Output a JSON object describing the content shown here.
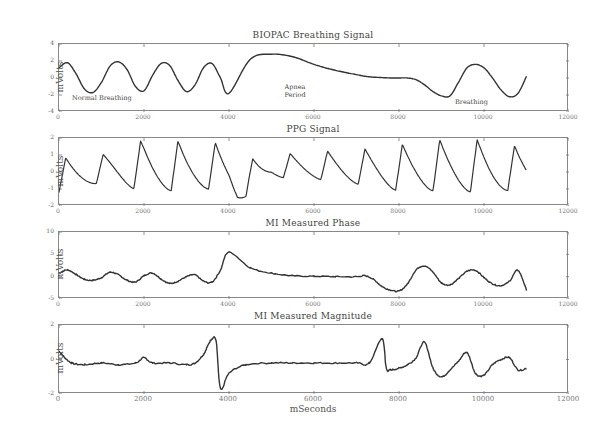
{
  "xlabel": "mSeconds",
  "ylabel": "mVolts",
  "chart_data": [
    {
      "type": "line",
      "title": "BIOPAC Breathing Signal",
      "xlabel": "",
      "ylabel": "mVolts",
      "xlim": [
        0,
        12000
      ],
      "ylim": [
        -4,
        4
      ],
      "xticks": [
        "0",
        "2000",
        "4000",
        "6000",
        "8000",
        "10000",
        "12000"
      ],
      "yticks": [
        "4",
        "2",
        "0",
        "-2",
        "-4"
      ],
      "annotations": [
        {
          "text": "Normal Breathing",
          "x": 1400,
          "y": -2.6
        },
        {
          "text": "Apnea Period",
          "x": 5900,
          "y": -1.8
        },
        {
          "text": "Breathing",
          "x": 9500,
          "y": -3.0
        }
      ],
      "x": [
        0,
        200,
        400,
        600,
        800,
        1000,
        1200,
        1400,
        1600,
        1800,
        2000,
        2200,
        2400,
        2600,
        2800,
        3000,
        3200,
        3400,
        3600,
        3800,
        4000,
        4500,
        5000,
        5500,
        6000,
        6500,
        7000,
        7200,
        7400,
        7600,
        7800,
        8000,
        8200,
        8400,
        8600,
        8800,
        9000,
        9200,
        9400,
        9600,
        9800,
        10000,
        10200,
        10400,
        10600,
        10800,
        11000
      ],
      "values": [
        1.2,
        1.8,
        0.5,
        -1.3,
        -1.7,
        -0.5,
        1.4,
        1.9,
        1.0,
        -1.0,
        -1.5,
        0.3,
        1.7,
        1.5,
        -0.3,
        -1.6,
        -0.8,
        1.2,
        1.7,
        0.0,
        -1.8,
        2.2,
        2.8,
        2.5,
        1.6,
        0.9,
        0.4,
        0.2,
        0.1,
        0.05,
        0.0,
        0.0,
        0.0,
        -0.2,
        -0.8,
        -1.6,
        -2.1,
        -2.1,
        -0.5,
        1.2,
        1.6,
        1.2,
        0.0,
        -1.4,
        -2.2,
        -1.8,
        0.2
      ]
    },
    {
      "type": "line",
      "title": "PPG Signal",
      "ylabel": "mVolts",
      "xlim": [
        0,
        12000
      ],
      "ylim": [
        -2,
        2
      ],
      "xticks": [
        "0",
        "2000",
        "4000",
        "6000",
        "8000",
        "10000",
        "12000"
      ],
      "yticks": [
        "2",
        "1",
        "0",
        "-1",
        "-2"
      ],
      "description": "Oscillating pulse waveform ~1.1 Hz, amplitude ~1.5-2.5 mV, dip to -1.8 near 4100 ms, reduced amplitude 4500-6500 ms, data ends near 11000 ms",
      "envelope": {
        "x": [
          0,
          1000,
          2000,
          3000,
          3500,
          4000,
          4200,
          5000,
          6000,
          7000,
          8000,
          9000,
          10000,
          11000
        ],
        "max": [
          0.8,
          1.0,
          1.9,
          1.8,
          1.9,
          1.4,
          0.6,
          1.0,
          1.2,
          1.3,
          1.6,
          1.9,
          1.9,
          1.4
        ],
        "min": [
          -1.2,
          -0.6,
          -1.1,
          -1.1,
          -1.0,
          -1.2,
          -1.8,
          -0.3,
          -0.4,
          -0.7,
          -1.1,
          -1.1,
          -1.2,
          -1.0
        ]
      }
    },
    {
      "type": "line",
      "title": "MI Measured Phase",
      "ylabel": "mVolts",
      "xlim": [
        0,
        12000
      ],
      "ylim": [
        -5,
        10
      ],
      "xticks": [
        "0",
        "2000",
        "4000",
        "6000",
        "8000",
        "10000",
        "12000"
      ],
      "yticks": [
        "10",
        "5",
        "0",
        "-5"
      ],
      "x": [
        0,
        200,
        400,
        600,
        800,
        1000,
        1200,
        1400,
        1600,
        1800,
        2000,
        2200,
        2400,
        2600,
        2800,
        3000,
        3200,
        3400,
        3600,
        3800,
        4000,
        4500,
        5000,
        5500,
        6000,
        6500,
        7000,
        7200,
        7400,
        7600,
        7800,
        8000,
        8200,
        8400,
        8600,
        8800,
        9000,
        9200,
        9400,
        9600,
        9800,
        10000,
        10200,
        10400,
        10600,
        10800,
        11000
      ],
      "values": [
        0.8,
        1.5,
        0.5,
        -0.6,
        -0.8,
        -0.2,
        1.0,
        0.4,
        -0.8,
        -1.2,
        0.2,
        0.8,
        -0.5,
        -1.5,
        -1.0,
        0.0,
        0.4,
        -1.0,
        -1.2,
        1.5,
        5.5,
        2.0,
        0.8,
        0.2,
        0.1,
        0.0,
        0.0,
        0.2,
        -0.6,
        -2.2,
        -3.0,
        -3.2,
        -1.6,
        1.5,
        2.4,
        1.0,
        -1.4,
        -1.8,
        -0.4,
        1.2,
        1.4,
        -0.2,
        -1.6,
        -2.0,
        -1.0,
        1.4,
        -3.0
      ]
    },
    {
      "type": "line",
      "title": "MI Measured Magnitude",
      "xlabel": "mSeconds",
      "ylabel": "mVolts",
      "xlim": [
        0,
        12000
      ],
      "ylim": [
        -2,
        2
      ],
      "xticks": [
        "0",
        "2000",
        "4000",
        "6000",
        "8000",
        "10000",
        "12000"
      ],
      "yticks": [
        "2",
        "0",
        "-2"
      ],
      "x": [
        0,
        100,
        300,
        600,
        1000,
        1400,
        1800,
        2000,
        2200,
        2600,
        3000,
        3200,
        3400,
        3500,
        3600,
        3700,
        3800,
        4000,
        4400,
        5000,
        5500,
        6000,
        6500,
        7000,
        7300,
        7600,
        7700,
        7800,
        8000,
        8200,
        8400,
        8600,
        8800,
        9000,
        9200,
        9400,
        9600,
        9800,
        10000,
        10200,
        10400,
        10600,
        10800,
        11000
      ],
      "values": [
        0.5,
        0.2,
        -0.2,
        -0.3,
        -0.2,
        -0.3,
        -0.2,
        0.1,
        -0.2,
        -0.2,
        -0.3,
        -0.2,
        0.3,
        0.8,
        1.2,
        1.0,
        -1.7,
        -0.8,
        -0.3,
        -0.2,
        -0.2,
        -0.2,
        -0.2,
        -0.2,
        -0.2,
        1.2,
        -0.5,
        -0.6,
        -0.5,
        -0.3,
        0.1,
        1.0,
        -0.5,
        -1.0,
        -0.6,
        -0.1,
        0.4,
        -0.8,
        -0.9,
        -0.3,
        0.0,
        0.1,
        -0.6,
        -0.5
      ]
    }
  ]
}
